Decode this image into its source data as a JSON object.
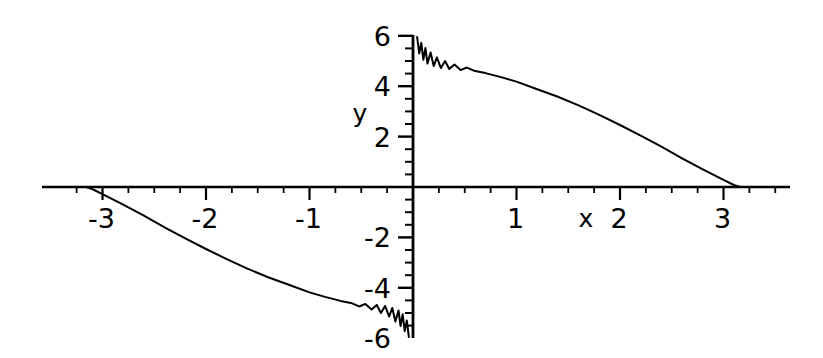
{
  "figure": {
    "background_color": "#ffffff",
    "line_color": "#000000",
    "axis_color": "#000000"
  },
  "axis_names": {
    "x": "x",
    "y": "y"
  },
  "x_tick_labels": [
    {
      "value": -3,
      "text": "-3"
    },
    {
      "value": -2,
      "text": "-2"
    },
    {
      "value": -1,
      "text": "-1"
    },
    {
      "value": 1,
      "text": "1"
    },
    {
      "value": 2,
      "text": "2"
    },
    {
      "value": 3,
      "text": "3"
    }
  ],
  "y_tick_labels": [
    {
      "value": 6,
      "text": "6"
    },
    {
      "value": 4,
      "text": "4"
    },
    {
      "value": 2,
      "text": "2"
    },
    {
      "value": -2,
      "text": "-2"
    },
    {
      "value": -4,
      "text": "-4"
    },
    {
      "value": -6,
      "text": "-6"
    }
  ],
  "chart_data": {
    "type": "line",
    "title": "",
    "xlabel": "x",
    "ylabel": "y",
    "xlim": [
      -3.45,
      3.55
    ],
    "ylim": [
      -6.4,
      6.4
    ],
    "grid": false,
    "legend": null,
    "axes_style": "cartesian-crossed-at-origin",
    "x_major_ticks": [
      -3,
      -2,
      -1,
      0,
      1,
      2,
      3
    ],
    "x_minor_tick_step": 0.25,
    "y_major_ticks": [
      -6,
      -4,
      -2,
      0,
      2,
      4,
      6
    ],
    "y_minor_tick_step": 0.5,
    "series": [
      {
        "name": "upper-branch",
        "points": [
          [
            0.04,
            5.95
          ],
          [
            0.06,
            5.3
          ],
          [
            0.08,
            5.72
          ],
          [
            0.1,
            5.05
          ],
          [
            0.12,
            5.52
          ],
          [
            0.14,
            4.9
          ],
          [
            0.17,
            5.34
          ],
          [
            0.2,
            4.8
          ],
          [
            0.23,
            5.14
          ],
          [
            0.27,
            4.72
          ],
          [
            0.31,
            5.0
          ],
          [
            0.35,
            4.68
          ],
          [
            0.4,
            4.86
          ],
          [
            0.46,
            4.64
          ],
          [
            0.52,
            4.74
          ],
          [
            0.6,
            4.6
          ],
          [
            0.7,
            4.52
          ],
          [
            0.85,
            4.36
          ],
          [
            1.0,
            4.18
          ],
          [
            1.2,
            3.88
          ],
          [
            1.4,
            3.58
          ],
          [
            1.6,
            3.24
          ],
          [
            1.8,
            2.86
          ],
          [
            2.0,
            2.46
          ],
          [
            2.2,
            2.04
          ],
          [
            2.4,
            1.6
          ],
          [
            2.6,
            1.14
          ],
          [
            2.8,
            0.7
          ],
          [
            3.0,
            0.28
          ],
          [
            3.1,
            0.08
          ],
          [
            3.16,
            0.0
          ]
        ]
      },
      {
        "name": "lower-branch",
        "points": [
          [
            -3.16,
            0.0
          ],
          [
            -3.1,
            -0.08
          ],
          [
            -3.0,
            -0.28
          ],
          [
            -2.8,
            -0.7
          ],
          [
            -2.6,
            -1.14
          ],
          [
            -2.4,
            -1.6
          ],
          [
            -2.2,
            -2.04
          ],
          [
            -2.0,
            -2.46
          ],
          [
            -1.8,
            -2.86
          ],
          [
            -1.6,
            -3.24
          ],
          [
            -1.4,
            -3.58
          ],
          [
            -1.2,
            -3.88
          ],
          [
            -1.0,
            -4.18
          ],
          [
            -0.85,
            -4.36
          ],
          [
            -0.7,
            -4.52
          ],
          [
            -0.6,
            -4.6
          ],
          [
            -0.52,
            -4.74
          ],
          [
            -0.46,
            -4.64
          ],
          [
            -0.4,
            -4.86
          ],
          [
            -0.35,
            -4.68
          ],
          [
            -0.31,
            -5.0
          ],
          [
            -0.27,
            -4.72
          ],
          [
            -0.23,
            -5.14
          ],
          [
            -0.2,
            -4.8
          ],
          [
            -0.17,
            -5.34
          ],
          [
            -0.14,
            -4.9
          ],
          [
            -0.12,
            -5.52
          ],
          [
            -0.1,
            -5.05
          ],
          [
            -0.08,
            -5.72
          ],
          [
            -0.06,
            -5.3
          ],
          [
            -0.04,
            -5.95
          ]
        ]
      }
    ]
  }
}
